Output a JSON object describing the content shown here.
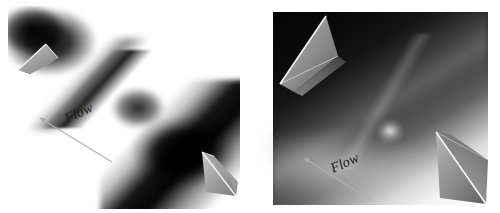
{
  "figure": {
    "type": "two-panel-grayscale-flow-visualization",
    "background_color": "#ffffff",
    "width": 500,
    "height": 213,
    "panels": [
      {
        "id": "left",
        "name": "left-flow-image",
        "description": "Grayscale flow visualization between two opposed wedge prisms with a narrow necked dark jet running from upper-left to lower-right",
        "flow_label": "Flow",
        "arrow_direction": "up-left",
        "arrow_angle_deg": -24,
        "arrow": {
          "tail_x": 112,
          "tail_y": 162,
          "tip_x": 38,
          "tip_y": 117
        },
        "wedges": [
          {
            "name": "upper-left-wedge",
            "position": "top-left"
          },
          {
            "name": "lower-right-wedge",
            "position": "bottom-right"
          }
        ]
      },
      {
        "id": "right",
        "name": "right-flow-image",
        "description": "Grayscale flow visualization in a rectangular photograph frame showing a dark channel between two wedge prisms with a bright lower boundary layer",
        "flow_label": "Flow",
        "arrow_direction": "up-left",
        "arrow_angle_deg": -24,
        "arrow": {
          "tail_x": 372,
          "tail_y": 201,
          "tip_x": 302,
          "tip_y": 157
        },
        "wedges": [
          {
            "name": "upper-left-wedge",
            "position": "top-left"
          },
          {
            "name": "lower-right-wedge",
            "position": "bottom-right"
          }
        ]
      }
    ],
    "colors": {
      "background": "#ffffff",
      "image_dark": "#000000",
      "image_light": "#ffffff",
      "wedge_face": "#9a9a9a",
      "wedge_edge": "#f2f2f2",
      "annotation": "#1a1a1a",
      "arrow": "#b4b4b4"
    }
  }
}
